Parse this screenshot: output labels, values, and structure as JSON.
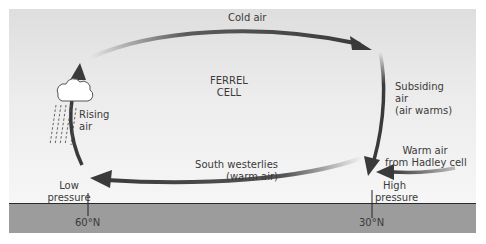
{
  "diagram": {
    "title": "Ferrel cell",
    "cell_label": [
      "FERREL",
      "CELL"
    ],
    "labels": {
      "cold_air": "Cold air",
      "subsiding": [
        "Subsiding",
        "air",
        "(air warms)"
      ],
      "rising": [
        "Rising",
        "air"
      ],
      "south_westerlies": [
        "South westerlies",
        "(warm air)"
      ],
      "warm_air_hadley": [
        "Warm air",
        "from Hadley cell"
      ],
      "low_pressure": [
        "Low",
        "pressure"
      ],
      "high_pressure": [
        "High",
        "pressure"
      ],
      "lat_60": "60°N",
      "lat_30": "30°N"
    },
    "colors": {
      "arrow": "#3a3a3a",
      "ground": "#9c9c9c",
      "sky_top": "#dedede",
      "sky_bottom": "#f6f6f6",
      "text": "#3a3a3a"
    }
  }
}
